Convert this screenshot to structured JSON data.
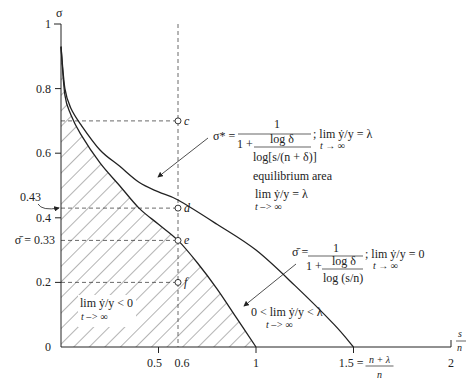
{
  "chart_data": {
    "type": "line",
    "title": "",
    "xlabel": "s/n",
    "ylabel": "σ",
    "xlim": [
      0,
      2
    ],
    "ylim": [
      0,
      1
    ],
    "x_ticks": [
      {
        "value": 0.5,
        "label": "0.5"
      },
      {
        "value": 0.6,
        "label": "0.6"
      },
      {
        "value": 1,
        "label": "1"
      },
      {
        "value": 1.5,
        "label": "1.5 ="
      },
      {
        "value": 2,
        "label": "2"
      }
    ],
    "x_tick_1_5_fraction": {
      "num": "n + λ",
      "den": "n"
    },
    "y_ticks": [
      {
        "value": 0,
        "label": "0"
      },
      {
        "value": 0.2,
        "label": "0.2"
      },
      {
        "value": 0.4,
        "label": "0.4"
      },
      {
        "value": 0.6,
        "label": "0.6"
      },
      {
        "value": 0.8,
        "label": "0.8"
      },
      {
        "value": 1,
        "label": "1"
      }
    ],
    "y_special": [
      {
        "value": 0.33,
        "label": "σ̄ = 0.33"
      },
      {
        "value": 0.43,
        "label": "0.43"
      }
    ],
    "series": [
      {
        "name": "σ̄ curve",
        "x_intercept": 1,
        "points": [
          [
            0.0,
            0.93
          ],
          [
            0.02,
            0.78
          ],
          [
            0.05,
            0.72
          ],
          [
            0.1,
            0.66
          ],
          [
            0.2,
            0.57
          ],
          [
            0.3,
            0.5
          ],
          [
            0.4,
            0.43
          ],
          [
            0.5,
            0.38
          ],
          [
            0.6,
            0.33
          ],
          [
            0.7,
            0.26
          ],
          [
            0.8,
            0.18
          ],
          [
            0.9,
            0.09
          ],
          [
            1.0,
            0.0
          ]
        ]
      },
      {
        "name": "σ* curve",
        "x_intercept": 1.5,
        "points": [
          [
            0.0,
            0.93
          ],
          [
            0.02,
            0.8
          ],
          [
            0.05,
            0.74
          ],
          [
            0.1,
            0.69
          ],
          [
            0.2,
            0.61
          ],
          [
            0.3,
            0.56
          ],
          [
            0.4,
            0.51
          ],
          [
            0.5,
            0.48
          ],
          [
            0.6,
            0.455
          ],
          [
            0.8,
            0.38
          ],
          [
            1.0,
            0.3
          ],
          [
            1.2,
            0.19
          ],
          [
            1.4,
            0.07
          ],
          [
            1.5,
            0.0
          ]
        ]
      }
    ],
    "points": [
      {
        "label": "c",
        "x": 0.6,
        "y": 0.7
      },
      {
        "label": "d",
        "x": 0.6,
        "y": 0.43
      },
      {
        "label": "e",
        "x": 0.6,
        "y": 0.33
      },
      {
        "label": "f",
        "x": 0.6,
        "y": 0.2
      }
    ],
    "grid": false
  },
  "annotations": {
    "sigma_star": {
      "lhs": "σ* =",
      "num": "1",
      "den_prefix": "1 +",
      "den_num": "log δ",
      "den_den": "log[s/(n + δ)]",
      "cond": "; lim ẏ/y = λ",
      "cond_sub": "t → ∞"
    },
    "equilibrium": {
      "title": "equilibrium area",
      "line": "lim ẏ/y = λ",
      "sub": "t –> ∞"
    },
    "sigma_bar": {
      "lhs": "σ̄ =",
      "num": "1",
      "den_prefix": "1 +",
      "den_num": "log δ",
      "den_den": "log (s/n)",
      "cond": "; lim ẏ/y = 0",
      "cond_sub": "t → ∞"
    },
    "middle_region": {
      "line": "0 < lim ẏ/y < λ",
      "sub": "t –> ∞"
    },
    "hatched_region": {
      "line": "lim ẏ/y < 0",
      "sub": "t –> ∞"
    }
  }
}
